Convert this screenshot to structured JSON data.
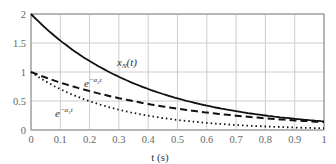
{
  "chart_data": {
    "type": "line",
    "title": "",
    "xlabel": "t (s)",
    "ylabel": "",
    "xlim": [
      0,
      1
    ],
    "ylim": [
      0,
      2
    ],
    "grid": true,
    "x_ticks": [
      "0",
      "0.1",
      "0.2",
      "0.3",
      "0.4",
      "0.5",
      "0.6",
      "0.7",
      "0.8",
      "0.9",
      "1"
    ],
    "y_ticks": [
      "0",
      "0.5",
      "1",
      "1.5",
      "2"
    ],
    "x": [
      0,
      0.1,
      0.2,
      0.3,
      0.4,
      0.5,
      0.6,
      0.7,
      0.8,
      0.9,
      1.0
    ],
    "series": [
      {
        "name": "x_N(t)",
        "style": "solid",
        "values": [
          2.0,
          1.54,
          1.19,
          0.92,
          0.71,
          0.55,
          0.42,
          0.32,
          0.25,
          0.19,
          0.15
        ]
      },
      {
        "name": "e^{-α2 t}",
        "style": "dashed",
        "values": [
          1.0,
          0.82,
          0.67,
          0.55,
          0.45,
          0.37,
          0.3,
          0.25,
          0.2,
          0.17,
          0.14
        ]
      },
      {
        "name": "e^{-α1 t}",
        "style": "dotted",
        "values": [
          1.0,
          0.7,
          0.5,
          0.35,
          0.25,
          0.17,
          0.12,
          0.09,
          0.06,
          0.04,
          0.03
        ]
      }
    ],
    "annotations": [
      {
        "text": "x_N(t)",
        "x": 0.32,
        "y": 1.18
      },
      {
        "text": "e^{-α2 t}",
        "x": 0.2,
        "y": 0.82
      },
      {
        "text": "e^{-α1 t}",
        "x": 0.08,
        "y": 0.33
      }
    ]
  },
  "labels": {
    "xaxis": "t (s)",
    "series_xn_main": "x",
    "series_xn_sub": "N",
    "series_xn_arg": "(t)",
    "series_a2_base": "e",
    "series_a2_exp": "−α",
    "series_a2_sub": "2",
    "series_a2_t": "t",
    "series_a1_base": "e",
    "series_a1_exp": "−α",
    "series_a1_sub": "1",
    "series_a1_t": "t"
  }
}
